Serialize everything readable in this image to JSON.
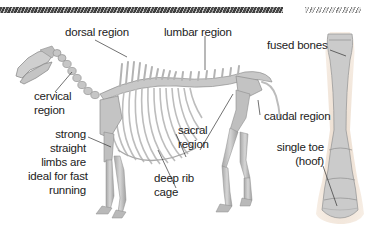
{
  "diagram": {
    "labels": {
      "dorsal_region": "dorsal region",
      "lumbar_region": "lumbar region",
      "cervical_region": [
        "cervical",
        "region"
      ],
      "sacral_region": [
        "sacral",
        "region"
      ],
      "caudal_region": "caudal region",
      "strong_limbs": [
        "strong",
        "straight",
        "limbs are",
        "ideal for fast",
        "running"
      ],
      "deep_rib_cage": [
        "deep rib",
        "cage"
      ],
      "fused_bones": "fused bones",
      "single_toe": [
        "single toe",
        "(hoof)"
      ]
    },
    "colors": {
      "bone": "#c9c9c9",
      "bone_shadow": "#9a9a9a",
      "leader_line": "#333333",
      "text": "#222222",
      "header_band": "#2a2a2a"
    }
  }
}
